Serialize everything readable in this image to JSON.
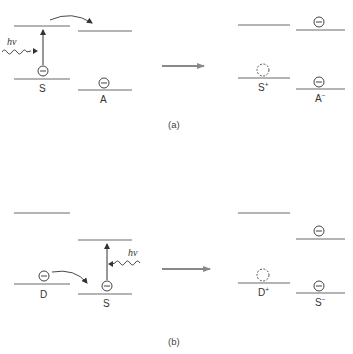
{
  "diagram": {
    "colors": {
      "level_line": "#6a6a6a",
      "text": "#333333",
      "process_arrow": "#888888",
      "background": "#ffffff"
    },
    "panels": [
      {
        "id": "a",
        "caption": "(a)",
        "description": "Oxidative quenching: excited sensitizer S transfers electron to acceptor A",
        "before": {
          "species": [
            {
              "name": "S",
              "upper_level": "empty",
              "lower_level": "electron",
              "excited_by": "hν"
            },
            {
              "name": "A",
              "upper_level": "empty",
              "lower_level": "electron"
            }
          ],
          "photon_label": "hν",
          "transfer": "S upper level → A upper level"
        },
        "after": {
          "species": [
            {
              "name": "S",
              "charge": "+",
              "upper_level": "empty",
              "lower_level": "hole"
            },
            {
              "name": "A",
              "charge": "−",
              "upper_level": "electron",
              "lower_level": "electron"
            }
          ]
        }
      },
      {
        "id": "b",
        "caption": "(b)",
        "description": "Reductive quenching: donor D transfers electron to excited sensitizer S",
        "before": {
          "species": [
            {
              "name": "D",
              "upper_level": "empty",
              "lower_level": "electron"
            },
            {
              "name": "S",
              "upper_level": "empty",
              "lower_level": "electron",
              "excited_by": "hν"
            }
          ],
          "photon_label": "hν",
          "transfer": "D lower level → S lower level"
        },
        "after": {
          "species": [
            {
              "name": "D",
              "charge": "+",
              "upper_level": "empty",
              "lower_level": "hole"
            },
            {
              "name": "S",
              "charge": "−",
              "upper_level": "electron",
              "lower_level": "electron"
            }
          ]
        }
      }
    ]
  },
  "labels": {
    "a_S": "S",
    "a_A": "A",
    "a_S_plus_base": "S",
    "a_S_plus_sup": "+",
    "a_A_minus_base": "A",
    "a_A_minus_sup": "−",
    "a_hv": "hν",
    "a_caption": "(a)",
    "b_D": "D",
    "b_S": "S",
    "b_D_plus_base": "D",
    "b_D_plus_sup": "+",
    "b_S_minus_base": "S",
    "b_S_minus_sup": "−",
    "b_hv": "hν",
    "b_caption": "(b)"
  }
}
